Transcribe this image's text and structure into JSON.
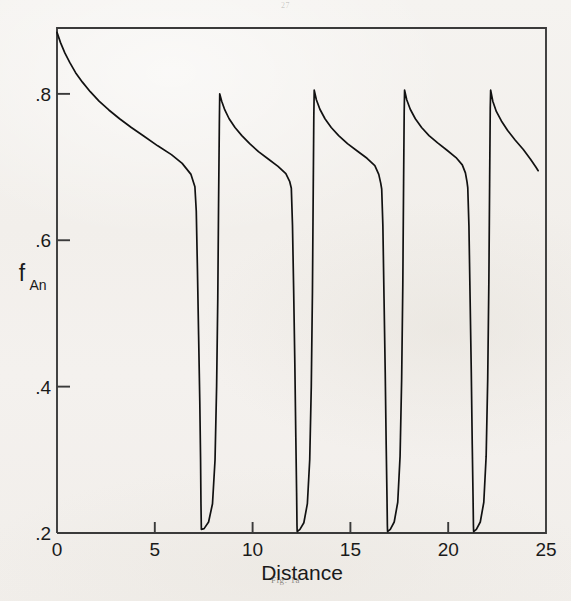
{
  "page": {
    "page_number": "27",
    "caption": "Fig. 1a"
  },
  "chart_data": {
    "type": "line",
    "title": "",
    "subtitle": "",
    "xlabel": "Distance",
    "ylabel": "f_An",
    "ylabel_base": "f",
    "ylabel_sub": "An",
    "xlim": [
      0,
      25
    ],
    "ylim": [
      0.2,
      0.89
    ],
    "xticks": [
      0,
      5,
      10,
      15,
      20,
      25
    ],
    "xtick_labels": [
      "0",
      "5",
      "10",
      "15",
      "20",
      "25"
    ],
    "yticks": [
      0.2,
      0.4,
      0.6,
      0.8
    ],
    "ytick_labels": [
      ".2",
      ".4",
      ".6",
      ".8"
    ],
    "grid": false,
    "legend": null,
    "line_color": "#111111",
    "frame_color": "#3a3a3a",
    "series": [
      {
        "name": "f_An",
        "points": [
          [
            0.0,
            0.884
          ],
          [
            0.18,
            0.87
          ],
          [
            0.4,
            0.856
          ],
          [
            0.65,
            0.843
          ],
          [
            0.95,
            0.829
          ],
          [
            1.3,
            0.816
          ],
          [
            1.7,
            0.803
          ],
          [
            2.15,
            0.79
          ],
          [
            2.65,
            0.778
          ],
          [
            3.2,
            0.766
          ],
          [
            3.8,
            0.754
          ],
          [
            4.45,
            0.742
          ],
          [
            5.15,
            0.729
          ],
          [
            5.85,
            0.717
          ],
          [
            6.4,
            0.705
          ],
          [
            6.85,
            0.69
          ],
          [
            7.05,
            0.673
          ],
          [
            7.12,
            0.64
          ],
          [
            7.18,
            0.56
          ],
          [
            7.24,
            0.47
          ],
          [
            7.3,
            0.38
          ],
          [
            7.34,
            0.3
          ],
          [
            7.36,
            0.24
          ],
          [
            7.38,
            0.205
          ],
          [
            7.52,
            0.206
          ],
          [
            7.75,
            0.215
          ],
          [
            7.95,
            0.24
          ],
          [
            8.08,
            0.3
          ],
          [
            8.16,
            0.4
          ],
          [
            8.22,
            0.52
          ],
          [
            8.26,
            0.65
          ],
          [
            8.3,
            0.76
          ],
          [
            8.32,
            0.8
          ],
          [
            8.42,
            0.79
          ],
          [
            8.58,
            0.778
          ],
          [
            8.8,
            0.766
          ],
          [
            9.1,
            0.754
          ],
          [
            9.45,
            0.743
          ],
          [
            9.85,
            0.732
          ],
          [
            10.3,
            0.721
          ],
          [
            10.8,
            0.711
          ],
          [
            11.3,
            0.701
          ],
          [
            11.7,
            0.691
          ],
          [
            11.9,
            0.68
          ],
          [
            11.98,
            0.671
          ],
          [
            12.04,
            0.62
          ],
          [
            12.1,
            0.53
          ],
          [
            12.16,
            0.43
          ],
          [
            12.21,
            0.33
          ],
          [
            12.25,
            0.255
          ],
          [
            12.27,
            0.21
          ],
          [
            12.28,
            0.202
          ],
          [
            12.42,
            0.205
          ],
          [
            12.62,
            0.214
          ],
          [
            12.8,
            0.24
          ],
          [
            12.92,
            0.3
          ],
          [
            13.0,
            0.4
          ],
          [
            13.06,
            0.53
          ],
          [
            13.1,
            0.67
          ],
          [
            13.13,
            0.77
          ],
          [
            13.15,
            0.805
          ],
          [
            13.26,
            0.792
          ],
          [
            13.44,
            0.779
          ],
          [
            13.7,
            0.766
          ],
          [
            14.02,
            0.754
          ],
          [
            14.4,
            0.743
          ],
          [
            14.85,
            0.732
          ],
          [
            15.35,
            0.722
          ],
          [
            15.85,
            0.712
          ],
          [
            16.25,
            0.702
          ],
          [
            16.45,
            0.69
          ],
          [
            16.55,
            0.678
          ],
          [
            16.6,
            0.67
          ],
          [
            16.66,
            0.62
          ],
          [
            16.72,
            0.52
          ],
          [
            16.78,
            0.42
          ],
          [
            16.83,
            0.32
          ],
          [
            16.87,
            0.25
          ],
          [
            16.89,
            0.21
          ],
          [
            16.9,
            0.202
          ],
          [
            17.04,
            0.205
          ],
          [
            17.24,
            0.215
          ],
          [
            17.42,
            0.242
          ],
          [
            17.54,
            0.305
          ],
          [
            17.62,
            0.41
          ],
          [
            17.68,
            0.54
          ],
          [
            17.72,
            0.68
          ],
          [
            17.75,
            0.775
          ],
          [
            17.77,
            0.805
          ],
          [
            17.88,
            0.792
          ],
          [
            18.06,
            0.779
          ],
          [
            18.32,
            0.766
          ],
          [
            18.64,
            0.754
          ],
          [
            19.02,
            0.743
          ],
          [
            19.46,
            0.733
          ],
          [
            19.94,
            0.723
          ],
          [
            20.4,
            0.713
          ],
          [
            20.72,
            0.703
          ],
          [
            20.88,
            0.692
          ],
          [
            20.96,
            0.68
          ],
          [
            21.0,
            0.672
          ],
          [
            21.06,
            0.62
          ],
          [
            21.12,
            0.52
          ],
          [
            21.18,
            0.42
          ],
          [
            21.23,
            0.32
          ],
          [
            21.27,
            0.25
          ],
          [
            21.29,
            0.21
          ],
          [
            21.3,
            0.202
          ],
          [
            21.44,
            0.205
          ],
          [
            21.64,
            0.215
          ],
          [
            21.82,
            0.242
          ],
          [
            21.94,
            0.305
          ],
          [
            22.02,
            0.41
          ],
          [
            22.08,
            0.545
          ],
          [
            22.12,
            0.685
          ],
          [
            22.15,
            0.78
          ],
          [
            22.17,
            0.805
          ],
          [
            22.28,
            0.79
          ],
          [
            22.46,
            0.776
          ],
          [
            22.72,
            0.763
          ],
          [
            23.04,
            0.75
          ],
          [
            23.42,
            0.737
          ],
          [
            23.84,
            0.724
          ],
          [
            24.2,
            0.711
          ],
          [
            24.48,
            0.7
          ],
          [
            24.6,
            0.695
          ]
        ]
      }
    ],
    "sawtooth_summary": {
      "cycles": 5,
      "peak_value": 0.8,
      "trough_value": 0.2,
      "drop_positions": [
        7.1,
        12.0,
        16.6,
        21.0
      ],
      "recovery_positions": [
        8.3,
        13.15,
        17.77,
        22.17
      ],
      "segment_end_values": [
        0.673,
        0.671,
        0.67,
        0.672,
        0.695
      ],
      "start_value": 0.884,
      "end_value": 0.695
    }
  }
}
